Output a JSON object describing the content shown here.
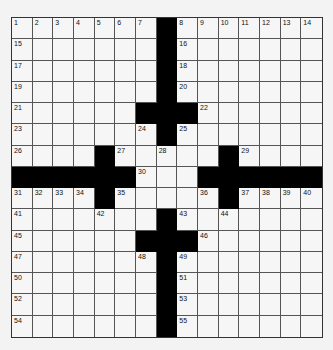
{
  "puzzle": {
    "rows": 15,
    "cols": 15,
    "colors": {
      "block": "#000000",
      "cell": "#f6f6f6",
      "background": "#f3f3f3"
    },
    "grid": [
      "1234567#8901234",
      "........#.......",
      "",
      "",
      "",
      "",
      "",
      "",
      "",
      "",
      "",
      "",
      "",
      "",
      ""
    ],
    "pattern": [
      ".......#.......",
      ".......#.......",
      ".......#.......",
      ".......#.......",
      "......###......",
      ".......#.......",
      "....#.....#....",
      "######...######",
      "....#.....#....",
      ".......#.......",
      "......###......",
      ".......#.......",
      ".......#.......",
      ".......#.......",
      ".......#......."
    ],
    "numbers": [
      {
        "r": 0,
        "c": 0,
        "n": "1"
      },
      {
        "r": 0,
        "c": 1,
        "n": "2"
      },
      {
        "r": 0,
        "c": 2,
        "n": "3"
      },
      {
        "r": 0,
        "c": 3,
        "n": "4"
      },
      {
        "r": 0,
        "c": 4,
        "n": "5"
      },
      {
        "r": 0,
        "c": 5,
        "n": "6"
      },
      {
        "r": 0,
        "c": 6,
        "n": "7"
      },
      {
        "r": 0,
        "c": 8,
        "n": "8"
      },
      {
        "r": 0,
        "c": 9,
        "n": "9"
      },
      {
        "r": 0,
        "c": 10,
        "n": "10"
      },
      {
        "r": 0,
        "c": 11,
        "n": "11"
      },
      {
        "r": 0,
        "c": 12,
        "n": "12"
      },
      {
        "r": 0,
        "c": 13,
        "n": "13"
      },
      {
        "r": 0,
        "c": 14,
        "n": "14"
      },
      {
        "r": 1,
        "c": 0,
        "n": "15"
      },
      {
        "r": 1,
        "c": 8,
        "n": "16"
      },
      {
        "r": 2,
        "c": 0,
        "n": "17"
      },
      {
        "r": 2,
        "c": 8,
        "n": "18"
      },
      {
        "r": 3,
        "c": 0,
        "n": "19"
      },
      {
        "r": 3,
        "c": 8,
        "n": "20"
      },
      {
        "r": 4,
        "c": 0,
        "n": "21"
      },
      {
        "r": 4,
        "c": 9,
        "n": "22"
      },
      {
        "r": 5,
        "c": 0,
        "n": "23"
      },
      {
        "r": 5,
        "c": 6,
        "n": "24"
      },
      {
        "r": 5,
        "c": 8,
        "n": "25"
      },
      {
        "r": 6,
        "c": 0,
        "n": "26"
      },
      {
        "r": 6,
        "c": 5,
        "n": "27"
      },
      {
        "r": 6,
        "c": 7,
        "n": "28"
      },
      {
        "r": 6,
        "c": 11,
        "n": "29"
      },
      {
        "r": 7,
        "c": 6,
        "n": "30"
      },
      {
        "r": 8,
        "c": 0,
        "n": "31"
      },
      {
        "r": 8,
        "c": 1,
        "n": "32"
      },
      {
        "r": 8,
        "c": 2,
        "n": "33"
      },
      {
        "r": 8,
        "c": 3,
        "n": "34"
      },
      {
        "r": 8,
        "c": 5,
        "n": "35"
      },
      {
        "r": 8,
        "c": 9,
        "n": "36"
      },
      {
        "r": 8,
        "c": 11,
        "n": "37"
      },
      {
        "r": 8,
        "c": 12,
        "n": "38"
      },
      {
        "r": 8,
        "c": 13,
        "n": "39"
      },
      {
        "r": 8,
        "c": 14,
        "n": "40"
      },
      {
        "r": 9,
        "c": 0,
        "n": "41"
      },
      {
        "r": 9,
        "c": 4,
        "n": "42"
      },
      {
        "r": 9,
        "c": 8,
        "n": "43"
      },
      {
        "r": 9,
        "c": 10,
        "n": "44"
      },
      {
        "r": 10,
        "c": 0,
        "n": "45"
      },
      {
        "r": 10,
        "c": 9,
        "n": "46"
      },
      {
        "r": 11,
        "c": 0,
        "n": "47"
      },
      {
        "r": 11,
        "c": 6,
        "n": "48"
      },
      {
        "r": 11,
        "c": 8,
        "n": "49"
      },
      {
        "r": 12,
        "c": 0,
        "n": "50"
      },
      {
        "r": 12,
        "c": 8,
        "n": "51"
      },
      {
        "r": 13,
        "c": 0,
        "n": "52"
      },
      {
        "r": 13,
        "c": 8,
        "n": "53"
      },
      {
        "r": 14,
        "c": 0,
        "n": "54"
      },
      {
        "r": 14,
        "c": 8,
        "n": "55"
      }
    ]
  }
}
